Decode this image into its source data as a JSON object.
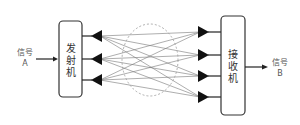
{
  "diagram": {
    "type": "mimo-system",
    "transmitter": {
      "label_chars": [
        "发",
        "射",
        "机"
      ],
      "antenna_count": 3
    },
    "receiver": {
      "label_chars": [
        "接",
        "收",
        "机"
      ],
      "antenna_count": 4
    },
    "input": {
      "line1": "信号",
      "line2": "A"
    },
    "output": {
      "line1": "信号",
      "line2": "B"
    },
    "channel": {
      "shape": "dashed-ellipse"
    },
    "colors": {
      "stroke": "#222222",
      "paths": "#777777",
      "ellipse": "#999999",
      "text": "#555555"
    }
  }
}
